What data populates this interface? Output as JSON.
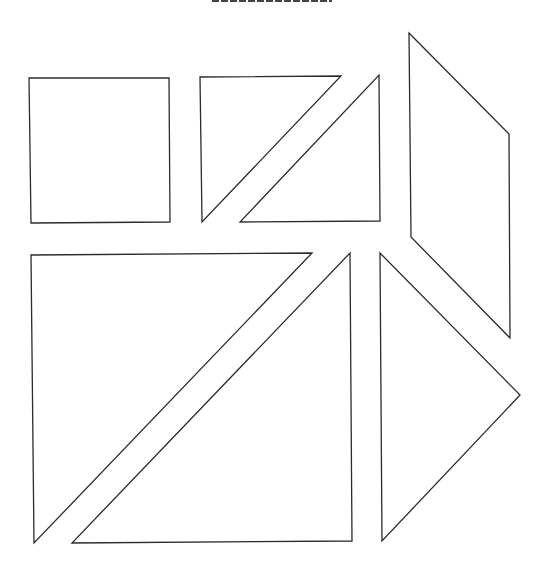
{
  "diagram": {
    "type": "tangram-pieces",
    "stroke_color": "#2b2b2b",
    "fill_color": "#ffffff",
    "title_visible": false,
    "pieces": [
      {
        "name": "square",
        "points": "29,78 169,78 170,222 31,223"
      },
      {
        "name": "small-triangle-1",
        "points": "200,77 341,76 202,222"
      },
      {
        "name": "small-triangle-2",
        "points": "379,75 380,221 240,222"
      },
      {
        "name": "parallelogram",
        "points": "409,33 509,134 510,338 411,237"
      },
      {
        "name": "large-triangle-1",
        "points": "31,255 312,253 34,543"
      },
      {
        "name": "large-triangle-2",
        "points": "350,253 352,541 72,543"
      },
      {
        "name": "medium-triangle",
        "points": "380,253 520,395 382,541"
      }
    ]
  }
}
